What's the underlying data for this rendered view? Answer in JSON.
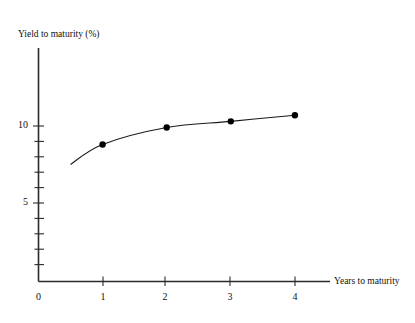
{
  "chart_data": {
    "type": "line",
    "title": "",
    "ylabel": "Yield to maturity (%)",
    "xlabel": "Years to maturity",
    "x": [
      1,
      2,
      3,
      4
    ],
    "values": [
      8.9,
      10.0,
      10.4,
      10.8
    ],
    "series": [
      {
        "name": "Yield curve",
        "x": [
          1,
          2,
          3,
          4
        ],
        "values": [
          8.9,
          10.0,
          10.4,
          10.8
        ]
      }
    ],
    "curve_extension_start": {
      "x": 0.5,
      "y": 7.6
    },
    "xlim": [
      0,
      4.45
    ],
    "ylim": [
      0,
      13.2
    ],
    "xticks": [
      0,
      1,
      2,
      3,
      4
    ],
    "xtick_labels": [
      "0",
      "1",
      "2",
      "3",
      "4"
    ],
    "yticks": [
      1,
      2,
      3,
      4,
      5,
      6,
      7,
      8,
      9,
      10,
      11,
      12,
      13
    ],
    "ytick_labels_shown": {
      "5": "5",
      "10": "10"
    },
    "grid": false,
    "legend": false,
    "marker": "filled-circle",
    "colors": {
      "line": "#1a1a1a",
      "marker": "#000000",
      "axis": "#2b2b2b",
      "background": "#ffffff",
      "text": "#111111"
    }
  },
  "axis_labels": {
    "y_title": "Yield to maturity (%)",
    "x_title": "Years to maturity",
    "y_tick_10": "10",
    "y_tick_5": "5",
    "x_tick_0": "0",
    "x_tick_1": "1",
    "x_tick_2": "2",
    "x_tick_3": "3",
    "x_tick_4": "4"
  }
}
